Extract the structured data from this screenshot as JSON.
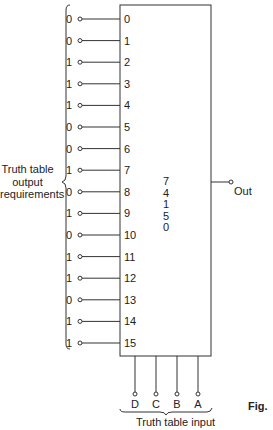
{
  "diagram": {
    "chip": {
      "label_lines": [
        "7",
        "4",
        "1",
        "5",
        "0"
      ],
      "name": "74150"
    },
    "data_inputs": [
      {
        "pin": "0",
        "value": "0"
      },
      {
        "pin": "1",
        "value": "0"
      },
      {
        "pin": "2",
        "value": "1"
      },
      {
        "pin": "3",
        "value": "1"
      },
      {
        "pin": "4",
        "value": "1"
      },
      {
        "pin": "5",
        "value": "0"
      },
      {
        "pin": "6",
        "value": "0"
      },
      {
        "pin": "7",
        "value": "1"
      },
      {
        "pin": "8",
        "value": "0"
      },
      {
        "pin": "9",
        "value": "1"
      },
      {
        "pin": "10",
        "value": "0"
      },
      {
        "pin": "11",
        "value": "1"
      },
      {
        "pin": "12",
        "value": "1"
      },
      {
        "pin": "13",
        "value": "0"
      },
      {
        "pin": "14",
        "value": "1"
      },
      {
        "pin": "15",
        "value": "1"
      }
    ],
    "select_inputs": [
      "D",
      "C",
      "B",
      "A"
    ],
    "output_label": "Out",
    "left_brace_label": [
      "Truth table",
      "output",
      "requirements"
    ],
    "bottom_brace_label": "Truth table input",
    "figure_label": "Fig."
  }
}
